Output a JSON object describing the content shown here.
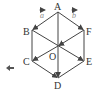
{
  "diagram": {
    "vertices": {
      "A": {
        "label": "A",
        "x": 58,
        "y": 12
      },
      "B": {
        "label": "B",
        "x": 32,
        "y": 30
      },
      "C": {
        "label": "C",
        "x": 32,
        "y": 61
      },
      "D": {
        "label": "D",
        "x": 58,
        "y": 78
      },
      "E": {
        "label": "E",
        "x": 84,
        "y": 61
      },
      "F": {
        "label": "F",
        "x": 84,
        "y": 30
      },
      "O": {
        "label": "O",
        "x": 58,
        "y": 46
      }
    },
    "vectors": {
      "a": {
        "label": "a",
        "from": "A",
        "to": "B"
      },
      "b": {
        "label": "b",
        "from": "A",
        "to": "F"
      }
    },
    "arrows": [
      {
        "from": "A",
        "to": "B"
      },
      {
        "from": "A",
        "to": "F"
      },
      {
        "from": "A",
        "to": "D"
      },
      {
        "from": "B",
        "to": "E"
      },
      {
        "from": "F",
        "to": "O"
      },
      {
        "from": "O",
        "to": "C"
      },
      {
        "from": "C",
        "to": "D"
      }
    ],
    "plain_edges": [
      {
        "from": "B",
        "to": "C"
      },
      {
        "from": "F",
        "to": "E"
      },
      {
        "from": "E",
        "to": "D"
      }
    ],
    "colors": {
      "line": "#444444",
      "label": "#333333",
      "vector_label": "#888888"
    }
  },
  "nav": {
    "back_icon": "left-arrow-icon"
  }
}
